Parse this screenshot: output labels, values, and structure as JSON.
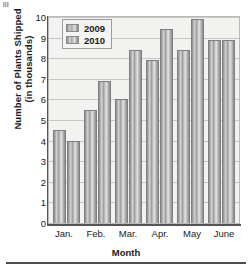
{
  "chart_data": {
    "type": "bar",
    "title": "",
    "xlabel": "Month",
    "ylabel_line1": "Number of Plants Shipped",
    "ylabel_line2": "(in thousands)",
    "categories": [
      "Jan.",
      "Feb.",
      "Mar.",
      "Apr.",
      "May",
      "June"
    ],
    "series": [
      {
        "name": "2009",
        "values": [
          4.5,
          5.5,
          6.0,
          7.9,
          8.4,
          8.9
        ]
      },
      {
        "name": "2010",
        "values": [
          4.0,
          6.9,
          8.4,
          9.4,
          9.9,
          8.9
        ]
      }
    ],
    "ylim": [
      0,
      10
    ],
    "yticks": [
      "0",
      "1",
      "2",
      "3",
      "4",
      "5",
      "6",
      "7",
      "8",
      "9",
      "10"
    ],
    "grid": true,
    "legend_position": "top-center",
    "bar_color": "#b5b5b5",
    "plot_background": "#f2f2f0",
    "gridline_color": "#c6c6c4"
  }
}
